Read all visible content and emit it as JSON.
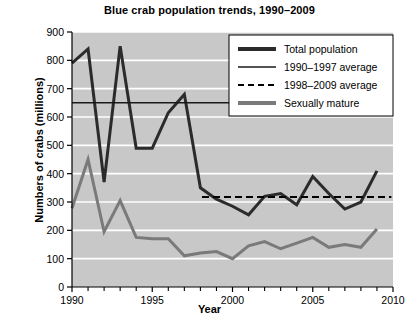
{
  "chart_data": {
    "type": "line",
    "title": "Blue crab population trends, 1990–2009",
    "xlabel": "Year",
    "ylabel": "Numbers of crabs (millions)",
    "xlim": [
      1990,
      2010
    ],
    "ylim": [
      0,
      900
    ],
    "ytick_values": [
      0,
      100,
      200,
      300,
      400,
      500,
      600,
      700,
      800,
      900
    ],
    "ytick_labels": [
      "0",
      "100",
      "200",
      "300",
      "400",
      "500",
      "600",
      "700",
      "800",
      "900"
    ],
    "xtick_values": [
      1990,
      1995,
      2000,
      2005,
      2010
    ],
    "xtick_labels": [
      "1990",
      "1995",
      "2000",
      "2005",
      "2010"
    ],
    "xtick_minor_values": [
      1991,
      1992,
      1993,
      1994,
      1996,
      1997,
      1998,
      1999,
      2001,
      2002,
      2003,
      2004,
      2006,
      2007,
      2008,
      2009
    ],
    "grid": "horizontal-white-gridlines",
    "plot_background": "#c8c8c8",
    "legend_position": "top-right",
    "x": [
      1990,
      1991,
      1992,
      1993,
      1994,
      1995,
      1996,
      1997,
      1998,
      1999,
      2000,
      2001,
      2002,
      2003,
      2004,
      2005,
      2006,
      2007,
      2008,
      2009
    ],
    "series": [
      {
        "name": "Total population",
        "color": "#2b2b2b",
        "style": "solid",
        "width": 3,
        "values": [
          790,
          840,
          370,
          850,
          490,
          490,
          615,
          680,
          350,
          310,
          285,
          255,
          320,
          330,
          290,
          390,
          330,
          275,
          300,
          410
        ]
      },
      {
        "name": "Sexually mature",
        "color": "#7a7a7a",
        "style": "solid",
        "width": 3,
        "values": [
          278,
          450,
          195,
          305,
          175,
          170,
          170,
          110,
          120,
          125,
          100,
          145,
          160,
          135,
          155,
          175,
          140,
          150,
          140,
          205
        ]
      }
    ],
    "reference_lines": [
      {
        "name": "1990–1997 average",
        "color": "#1a1a1a",
        "style": "solid",
        "width": 1.5,
        "value": 650,
        "x_start": 1990,
        "x_end": 2010
      },
      {
        "name": "1998–2009 average",
        "color": "#000000",
        "style": "dashed",
        "width": 2,
        "value": 318,
        "x_start": 1998.1,
        "x_end": 2009.9
      }
    ],
    "legend": [
      {
        "label": "Total population",
        "color": "#2b2b2b",
        "style": "solid",
        "width": 4
      },
      {
        "label": "1990–1997 average",
        "color": "#1a1a1a",
        "style": "solid",
        "width": 1.6
      },
      {
        "label": "1998–2009 average",
        "color": "#000000",
        "style": "dashed",
        "width": 2
      },
      {
        "label": "Sexually mature",
        "color": "#7a7a7a",
        "style": "solid",
        "width": 4
      }
    ]
  }
}
